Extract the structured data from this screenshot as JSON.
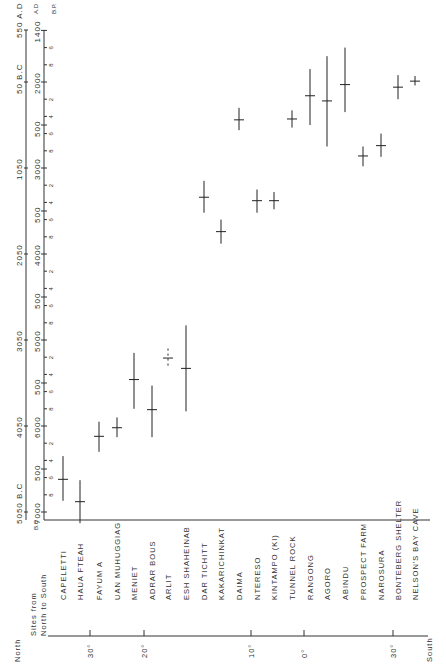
{
  "chart_data": {
    "type": "scatter",
    "orientation": "rotated-90-ccw",
    "title": "",
    "xlabel": "Sites from North to South",
    "ylabel": "B.P.",
    "secondary_axis_label": "B.C. / A.D.",
    "ylim_bp": [
      1400,
      7000
    ],
    "bp_ticks": [
      "1400",
      "2000",
      "500",
      "3000",
      "500",
      "4000",
      "500",
      "5000",
      "500",
      "6000",
      "500",
      "7000"
    ],
    "bp_minor_ticks": [
      "6",
      "8",
      "2",
      "4",
      "6",
      "8"
    ],
    "calendar_ticks": [
      "550 A.D",
      "50 B.C",
      "1050",
      "2050",
      "3050",
      "4050",
      "5050 B.C"
    ],
    "latitude_axis": {
      "start_label": "North",
      "end_label": "South",
      "ticks": [
        "30°",
        "20°",
        "10°",
        "0°",
        "30°"
      ]
    },
    "series": [
      {
        "name": "Radiocarbon dates (B.P.)",
        "points": [
          {
            "site": "CAPELETTI",
            "bp": 6620,
            "range": [
              6350,
              6870
            ]
          },
          {
            "site": "HAUA FTEAH",
            "bp": 6880,
            "range": [
              6630,
              7130
            ]
          },
          {
            "site": "FAYUM A",
            "bp": 6120,
            "range": [
              5950,
              6300
            ]
          },
          {
            "site": "UAN MUHUGGIAG",
            "bp": 6020,
            "range": [
              5900,
              6130
            ]
          },
          {
            "site": "MENIET",
            "bp": 5460,
            "range": [
              5150,
              5800
            ]
          },
          {
            "site": "ADRAR BOUS",
            "bp": 5810,
            "range": [
              5530,
              6130
            ]
          },
          {
            "site": "ARLIT",
            "bp": 5210,
            "range": [
              5100,
              5320
            ]
          },
          {
            "site": "ESH SHAHEINAB",
            "bp": 5330,
            "range": [
              4830,
              5830
            ]
          },
          {
            "site": "DAR TICHITT",
            "bp": 3340,
            "range": [
              3150,
              3520
            ]
          },
          {
            "site": "KAKARICHINKAT",
            "bp": 3740,
            "range": [
              3600,
              3880
            ]
          },
          {
            "site": "DAIMA",
            "bp": 2440,
            "range": [
              2300,
              2560
            ]
          },
          {
            "site": "NTERESO",
            "bp": 3380,
            "range": [
              3250,
              3520
            ]
          },
          {
            "site": "KINTAMPO (KI)",
            "bp": 3380,
            "range": [
              3280,
              3480
            ]
          },
          {
            "site": "TUNNEL ROCK",
            "bp": 2430,
            "range": [
              2330,
              2530
            ]
          },
          {
            "site": "RANGONG",
            "bp": 2160,
            "range": [
              1850,
              2500
            ]
          },
          {
            "site": "AGORO",
            "bp": 2220,
            "range": [
              1700,
              2750
            ]
          },
          {
            "site": "ABINDU",
            "bp": 2030,
            "range": [
              1600,
              2350
            ]
          },
          {
            "site": "PROSPECT FARM",
            "bp": 2860,
            "range": [
              2750,
              2980
            ]
          },
          {
            "site": "NAROSURA",
            "bp": 2740,
            "range": [
              2600,
              2870
            ]
          },
          {
            "site": "BONTEBERG SHELTER",
            "bp": 2060,
            "range": [
              1920,
              2200
            ]
          },
          {
            "site": "NELSON'S BAY CAVE",
            "bp": 1990,
            "range": [
              1930,
              2040
            ]
          }
        ]
      }
    ],
    "grid": false,
    "legend": null
  },
  "axis": {
    "bp_label": "B.P.",
    "ad_label": "A.D",
    "bc_label": "B.C",
    "sites_header": "Sites from North to South",
    "north": "North",
    "south": "South"
  }
}
